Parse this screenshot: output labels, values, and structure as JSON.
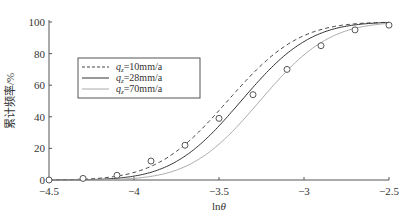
{
  "chart_data": {
    "type": "line",
    "title": "",
    "xlabel": "lnθ",
    "ylabel": "累计频率/%",
    "xlim": [
      -4.5,
      -2.5
    ],
    "ylim": [
      0,
      100
    ],
    "xticks": [
      -4.5,
      -4,
      -3.5,
      -3,
      -2.5
    ],
    "xtick_labels": [
      "-4.5",
      "-4",
      "-3.5",
      "-3",
      "-2.5"
    ],
    "yticks": [
      0,
      20,
      40,
      60,
      80,
      100
    ],
    "ytick_labels": [
      "0",
      "20",
      "40",
      "60",
      "80",
      "100"
    ],
    "grid": false,
    "legend_position": "upper left",
    "series": [
      {
        "name": "qz=10mm/a",
        "label_prefix": "q",
        "label_sub": "z",
        "label_suffix": "=10mm/a",
        "style": "dashed",
        "color": "#444444",
        "mu": -3.45,
        "sigma": 0.33
      },
      {
        "name": "qz=28mm/a",
        "label_prefix": "q",
        "label_sub": "z",
        "label_suffix": "=28mm/a",
        "style": "solid",
        "color": "#333333",
        "mu": -3.37,
        "sigma": 0.32
      },
      {
        "name": "qz=70mm/a",
        "label_prefix": "q",
        "label_sub": "z",
        "label_suffix": "=70mm/a",
        "style": "solid",
        "color": "#aaaaaa",
        "mu": -3.26,
        "sigma": 0.32
      }
    ],
    "observed_points": {
      "marker": "circle",
      "x": [
        -4.5,
        -4.3,
        -4.1,
        -3.9,
        -3.7,
        -3.5,
        -3.3,
        -3.1,
        -2.9,
        -2.7,
        -2.5
      ],
      "y": [
        0,
        1,
        3,
        12,
        22,
        39,
        54,
        70,
        85,
        95,
        98
      ]
    }
  }
}
